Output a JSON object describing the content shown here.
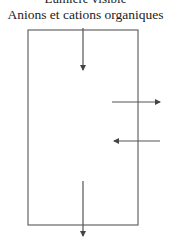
{
  "diagram": {
    "cut_title": "Lumière visible",
    "title": "Anions et cations organiques",
    "colors": {
      "stroke": "#555555",
      "text": "#222222"
    },
    "box": {
      "x": 28,
      "y": 30,
      "width": 110,
      "height": 195
    },
    "arrows": [
      {
        "name": "top-in-arrow",
        "direction": "down",
        "x1": 83,
        "y1": 28,
        "x2": 83,
        "y2": 70
      },
      {
        "name": "right-out-arrow",
        "direction": "right",
        "x1": 112,
        "y1": 102,
        "x2": 160,
        "y2": 102
      },
      {
        "name": "right-in-arrow",
        "direction": "left",
        "x1": 160,
        "y1": 141,
        "x2": 114,
        "y2": 141
      },
      {
        "name": "bottom-out-arrow",
        "direction": "down",
        "x1": 83,
        "y1": 181,
        "x2": 83,
        "y2": 236
      }
    ]
  }
}
